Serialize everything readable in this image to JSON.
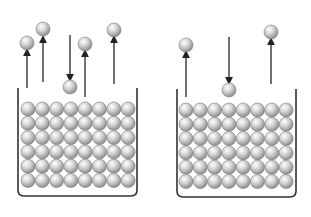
{
  "diagram": {
    "ball_color": "#c8c8c8",
    "stroke_color": "#333333",
    "containers": [
      {
        "id": "left",
        "x": 18,
        "y": 88,
        "w": 119,
        "h": 108,
        "grid": {
          "cols": 8,
          "rows": 6,
          "x0": 28,
          "y0": 109,
          "dx": 14.3,
          "dy": 14.3,
          "r": 7
        },
        "free_molecules": [
          {
            "x": 27,
            "y": 43,
            "arrow": "up",
            "arrow_from": 88,
            "arrow_to": 52
          },
          {
            "x": 43,
            "y": 29,
            "arrow": "up",
            "arrow_from": 82,
            "arrow_to": 39
          },
          {
            "x": 70,
            "y": 87,
            "arrow": "down",
            "arrow_from": 35,
            "arrow_to": 78
          },
          {
            "x": 85,
            "y": 44,
            "arrow": "up",
            "arrow_from": 97,
            "arrow_to": 53
          },
          {
            "x": 114,
            "y": 30,
            "arrow": "up",
            "arrow_from": 84,
            "arrow_to": 39
          }
        ]
      },
      {
        "id": "right",
        "x": 177,
        "y": 89,
        "w": 119,
        "h": 108,
        "grid": {
          "cols": 8,
          "rows": 6,
          "x0": 186,
          "y0": 110,
          "dx": 14.3,
          "dy": 14.3,
          "r": 7
        },
        "free_molecules": [
          {
            "x": 186,
            "y": 45,
            "arrow": "up",
            "arrow_from": 97,
            "arrow_to": 54
          },
          {
            "x": 229,
            "y": 90,
            "arrow": "down",
            "arrow_from": 37,
            "arrow_to": 81
          },
          {
            "x": 271,
            "y": 32,
            "arrow": "up",
            "arrow_from": 84,
            "arrow_to": 41
          }
        ]
      }
    ]
  }
}
